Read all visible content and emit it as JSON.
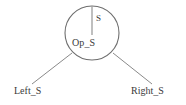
{
  "diagram": {
    "type": "tree",
    "root_node": {
      "name": "root-node-circle",
      "shape": "circle",
      "label": "Op_S",
      "head_label": "S",
      "center_x": 92,
      "center_y": 33,
      "radius": 27
    },
    "children": [
      {
        "name": "left-child",
        "label": "Left_S",
        "position": "bottom-left"
      },
      {
        "name": "right-child",
        "label": "Right_S",
        "position": "bottom-right"
      }
    ],
    "edges": [
      {
        "name": "head-edge",
        "from": "circle-top",
        "to": "circle-center",
        "x1": 92,
        "y1": 6,
        "x2": 92,
        "y2": 35
      },
      {
        "name": "left-edge",
        "from": "root-node",
        "to": "left-child",
        "x1": 72,
        "y1": 53,
        "x2": 32,
        "y2": 84
      },
      {
        "name": "right-edge",
        "from": "root-node",
        "to": "right-child",
        "x1": 113,
        "y1": 53,
        "x2": 152,
        "y2": 84
      }
    ],
    "colors": {
      "stroke": "#6e6e6e",
      "text": "#3a3a3a",
      "background": "#ffffff"
    }
  }
}
